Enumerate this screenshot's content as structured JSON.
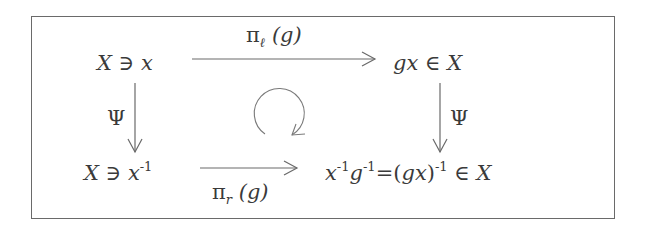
{
  "diagram": {
    "type": "commutative-diagram",
    "nodes": {
      "top_left": {
        "set": "X",
        "relation": "∋",
        "element": "x"
      },
      "top_right": {
        "element": "gx",
        "relation": "∈",
        "set": "X"
      },
      "bottom_left": {
        "set": "X",
        "relation": "∋",
        "element": "x",
        "exponent": "-1"
      },
      "bottom_right": {
        "lhs_a": "x",
        "lhs_a_exp": "-1",
        "lhs_b": "g",
        "lhs_b_exp": "-1",
        "equals": "=",
        "rhs_open": "(",
        "rhs_inner": "gx",
        "rhs_close": ")",
        "rhs_exp": "-1",
        "relation": "∈",
        "set": "X"
      }
    },
    "arrows": {
      "top": {
        "symbol": "π",
        "subscript": "ℓ",
        "arg": "(g)",
        "from": "top_left",
        "to": "top_right"
      },
      "bottom": {
        "symbol": "π",
        "subscript": "r",
        "arg": "(g)",
        "from": "bottom_left",
        "to": "bottom_right"
      },
      "left": {
        "label": "Ψ",
        "from": "top_left",
        "to": "bottom_left"
      },
      "right": {
        "label": "Ψ",
        "from": "top_right",
        "to": "bottom_right"
      }
    },
    "center_symbol": "commutes-circular-arrow",
    "colors": {
      "text": "#3a3a3a",
      "lines": "#6a6a6a",
      "frame": "#6a6a6a",
      "background": "#ffffff"
    }
  }
}
